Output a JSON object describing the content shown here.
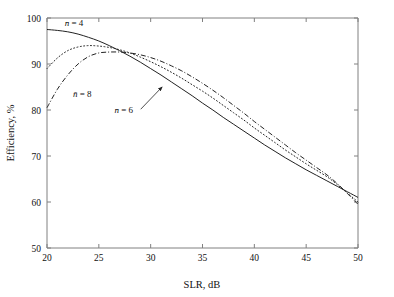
{
  "chart_data": {
    "type": "line",
    "title": "",
    "xlabel": "SLR, dB",
    "ylabel": "Efficiency, %",
    "xlim": [
      20,
      50
    ],
    "ylim": [
      50,
      100
    ],
    "xticks": [
      20,
      25,
      30,
      35,
      40,
      45,
      50
    ],
    "yticks": [
      50,
      60,
      70,
      80,
      90,
      100
    ],
    "xtick_labels": [
      "20",
      "25",
      "30",
      "35",
      "40",
      "45",
      "50"
    ],
    "ytick_labels": [
      "50",
      "60",
      "70",
      "80",
      "90",
      "100"
    ],
    "grid": false,
    "legend": "inline-annotations",
    "x": [
      20,
      21,
      22,
      23,
      24,
      25,
      26,
      27,
      28,
      29,
      30,
      31,
      32,
      33,
      34,
      35,
      36,
      37,
      38,
      39,
      40,
      41,
      42,
      43,
      44,
      45,
      46,
      47,
      48,
      49,
      50
    ],
    "series": [
      {
        "name": "n-bar = 4",
        "style": "solid",
        "color": "#222222",
        "label": "n̄ = 4",
        "values": [
          97.5,
          97.3,
          97.0,
          96.5,
          95.8,
          95.0,
          94.0,
          92.9,
          91.7,
          90.4,
          89.0,
          87.6,
          86.1,
          84.6,
          83.1,
          81.5,
          80.0,
          78.4,
          76.9,
          75.4,
          73.9,
          72.4,
          71.0,
          69.6,
          68.3,
          67.0,
          65.8,
          64.6,
          63.4,
          62.2,
          61.0
        ]
      },
      {
        "name": "n-bar = 6",
        "style": "dotted",
        "color": "#222222",
        "label": "n̄ = 6",
        "values": [
          89.0,
          91.3,
          92.9,
          93.7,
          94.0,
          93.9,
          93.6,
          93.1,
          92.4,
          91.5,
          90.5,
          89.4,
          88.2,
          86.9,
          85.5,
          84.1,
          82.6,
          81.0,
          79.4,
          77.8,
          76.1,
          74.5,
          72.9,
          71.3,
          69.8,
          68.3,
          66.9,
          65.5,
          63.8,
          61.9,
          60.0
        ]
      },
      {
        "name": "n-bar = 8",
        "style": "dash-dot",
        "color": "#222222",
        "label": "n̄ = 8",
        "values": [
          80.5,
          84.5,
          87.6,
          90.0,
          91.6,
          92.4,
          92.6,
          92.6,
          92.4,
          92.0,
          91.4,
          90.6,
          89.6,
          88.5,
          87.2,
          85.8,
          84.3,
          82.7,
          81.0,
          79.3,
          77.5,
          75.8,
          74.1,
          72.4,
          70.7,
          69.1,
          67.5,
          65.9,
          64.0,
          61.8,
          59.5
        ]
      }
    ],
    "annotations": [
      {
        "id": "label-n4",
        "text": "n̄ = 4",
        "x_data": 22.6,
        "y_data": 98.2,
        "leader": false
      },
      {
        "id": "label-n8",
        "text": "n̄ = 8",
        "x_data": 23.4,
        "y_data": 82.8,
        "leader": false
      },
      {
        "id": "label-n6",
        "text": "n̄ = 6",
        "x_data": 27.4,
        "y_data": 79.3,
        "leader": true,
        "leader_to_x": 31.1,
        "leader_to_y": 85.0
      }
    ]
  },
  "figure": {
    "background": "#ffffff",
    "axis_color": "#808080",
    "curve_color": "#222222",
    "xlabel": "SLR, dB",
    "ylabel": "Efficiency, %"
  }
}
